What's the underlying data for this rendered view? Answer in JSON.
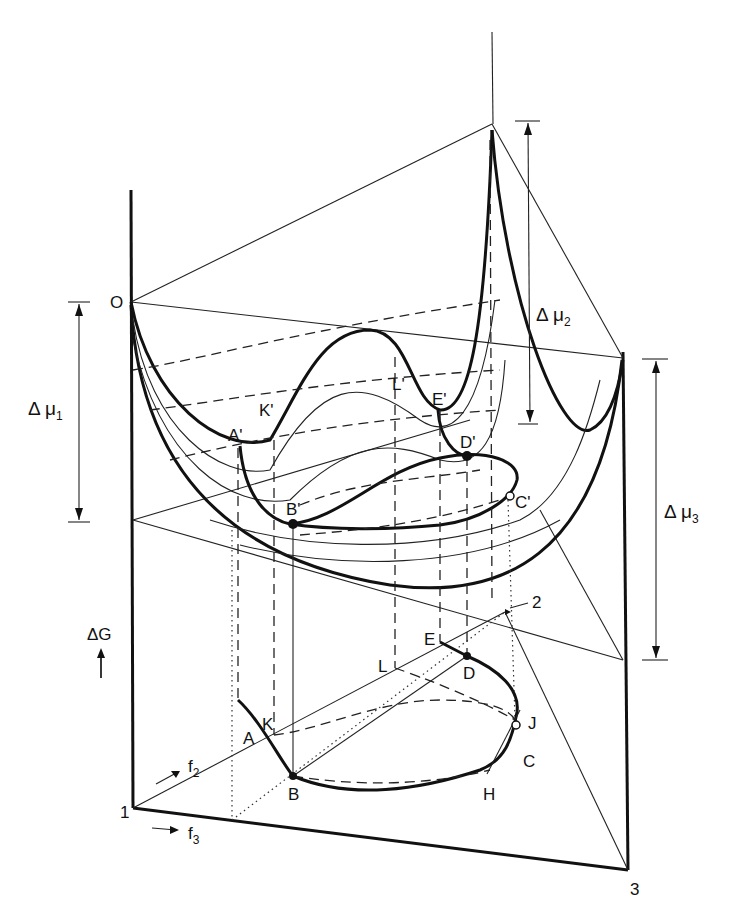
{
  "figure": {
    "type": "ternary free-energy surface diagram",
    "vertical_axis": {
      "label": "ΔG",
      "arrow": "up-arrow"
    },
    "composition_axes": [
      {
        "label": "f",
        "subscript": "2"
      },
      {
        "label": "f",
        "subscript": "3"
      }
    ],
    "corners": {
      "c1": "1",
      "c2": "2",
      "c3": "3",
      "origin": "O"
    },
    "potentials": [
      {
        "id": "mu1",
        "label": "Δ μ",
        "subscript": "1"
      },
      {
        "id": "mu2",
        "label": "Δ μ",
        "subscript": "2"
      },
      {
        "id": "mu3",
        "label": "Δ μ",
        "subscript": "3"
      }
    ],
    "surface_points": {
      "A": "A'",
      "K": "K'",
      "L": "L'",
      "E": "E'",
      "B": "B'",
      "D": "D'",
      "C": "C'"
    },
    "base_points": {
      "A": "A",
      "K": "K",
      "B": "B",
      "L": "L",
      "E": "E",
      "D": "D",
      "J": "J",
      "C": "C",
      "H": "H"
    }
  }
}
